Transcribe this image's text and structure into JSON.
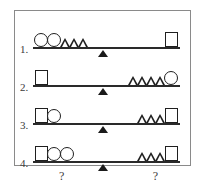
{
  "puzzle": {
    "type": "balance-scale-logic-puzzle",
    "frame_border_color": "#8a8a8a",
    "ink_color": "#1f1f1f",
    "shape_names": {
      "square": "square-shape",
      "circle": "circle-shape",
      "triangle": "triangle-shape"
    },
    "fulcrum_name": "fulcrum-triangle-icon",
    "rows": [
      {
        "label": "1.",
        "left": {
          "shapes": [
            "circle",
            "circle",
            "triangle",
            "triangle",
            "triangle"
          ],
          "counts": {
            "square": 0,
            "circle": 2,
            "triangle": 3
          },
          "question": ""
        },
        "right": {
          "shapes": [
            "square"
          ],
          "counts": {
            "square": 1,
            "circle": 0,
            "triangle": 0
          },
          "question": ""
        }
      },
      {
        "label": "2.",
        "left": {
          "shapes": [
            "square"
          ],
          "counts": {
            "square": 1,
            "circle": 0,
            "triangle": 0
          },
          "question": ""
        },
        "right": {
          "shapes": [
            "triangle",
            "triangle",
            "triangle",
            "triangle",
            "circle"
          ],
          "counts": {
            "square": 0,
            "circle": 1,
            "triangle": 4
          },
          "question": ""
        }
      },
      {
        "label": "3.",
        "left": {
          "shapes": [
            "square",
            "circle"
          ],
          "counts": {
            "square": 1,
            "circle": 1,
            "triangle": 0
          },
          "question": ""
        },
        "right": {
          "shapes": [
            "triangle",
            "triangle",
            "triangle",
            "square"
          ],
          "counts": {
            "square": 1,
            "circle": 0,
            "triangle": 3
          },
          "question": ""
        }
      },
      {
        "label": "4.",
        "left": {
          "shapes": [
            "square",
            "circle",
            "circle"
          ],
          "counts": {
            "square": 1,
            "circle": 2,
            "triangle": 0
          },
          "question": "?"
        },
        "right": {
          "shapes": [
            "triangle",
            "triangle",
            "triangle",
            "square"
          ],
          "counts": {
            "square": 1,
            "circle": 0,
            "triangle": 3
          },
          "question": "?"
        }
      }
    ]
  }
}
